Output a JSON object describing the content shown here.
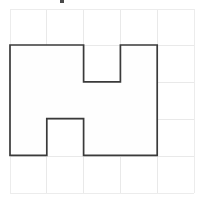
{
  "canvas": {
    "width": 199,
    "height": 201,
    "background_color": "#ffffff"
  },
  "grid": {
    "rows": 5,
    "cols": 5,
    "origin_x": 10,
    "origin_y": 9,
    "cell_width": 36.8,
    "cell_height": 36.8,
    "line_color": "#e9e9e9",
    "line_width": 1
  },
  "artifact": {
    "label": "speck-mark",
    "x": 60,
    "y": 0,
    "width": 4,
    "height": 3,
    "color": "#4a4a4a"
  },
  "chart_data": {
    "type": "diagram",
    "title": "",
    "xlabel": "",
    "ylabel": "",
    "grid_columns": 5,
    "grid_rows": 5,
    "occupied_cells": [
      [
        0,
        1
      ],
      [
        1,
        1
      ],
      [
        3,
        1
      ],
      [
        0,
        2
      ],
      [
        1,
        2
      ],
      [
        2,
        2
      ],
      [
        3,
        2
      ],
      [
        0,
        3
      ],
      [
        2,
        3
      ],
      [
        3,
        3
      ]
    ],
    "area_cells": 10,
    "perimeter_units": 22,
    "polygon_grid_vertices": [
      [
        0,
        1
      ],
      [
        2,
        1
      ],
      [
        2,
        2
      ],
      [
        3,
        2
      ],
      [
        3,
        1
      ],
      [
        4,
        1
      ],
      [
        4,
        4
      ],
      [
        2,
        4
      ],
      [
        2,
        3
      ],
      [
        1,
        3
      ],
      [
        1,
        4
      ],
      [
        0,
        4
      ]
    ],
    "polygon_pixel_points": "10,45 83.6,45 83.6,81.8 120.4,81.8 120.4,45 157.2,45 157.2,155.4 83.6,155.4 83.6,118.6 46.8,118.6 46.8,155.4 10,155.4",
    "stroke_color": "#3a3a3a",
    "fill_color": "#fefefe"
  },
  "shape": {
    "name": "notched-rectangle-polygon",
    "stroke_color": "#3a3a3a",
    "fill_color": "#fefefe",
    "stroke_width": 1.7,
    "points": "10,45 83.6,45 83.6,81.8 120.4,81.8 120.4,45 157.2,45 157.2,155.4 83.6,155.4 83.6,118.6 46.8,118.6 46.8,155.4 10,155.4"
  },
  "grid_lines": {
    "vertical_x": [
      10,
      46.8,
      83.6,
      120.4,
      157.2,
      194
    ],
    "horizontal_y": [
      9,
      45.8,
      82.6,
      119.4,
      156.2,
      193
    ]
  }
}
